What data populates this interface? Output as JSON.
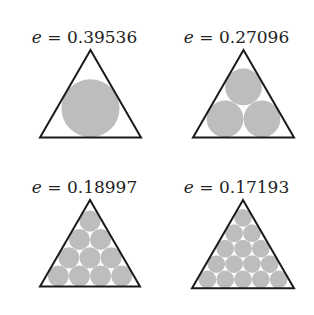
{
  "figure": {
    "panels": [
      {
        "label_var": "e",
        "label_eq": " = ",
        "label_value": "0.39536",
        "rows": 1,
        "circles": 1
      },
      {
        "label_var": "e",
        "label_eq": " = ",
        "label_value": "0.27096",
        "rows": 2,
        "circles": 3
      },
      {
        "label_var": "e",
        "label_eq": " = ",
        "label_value": "0.18997",
        "rows": 4,
        "circles": 10
      },
      {
        "label_var": "e",
        "label_eq": " = ",
        "label_value": "0.17193",
        "rows": 5,
        "circles": 15
      }
    ],
    "colors": {
      "triangle_stroke": "#1a1a1a",
      "circle_fill": "#bdbdbd",
      "background": "#ffffff"
    }
  }
}
